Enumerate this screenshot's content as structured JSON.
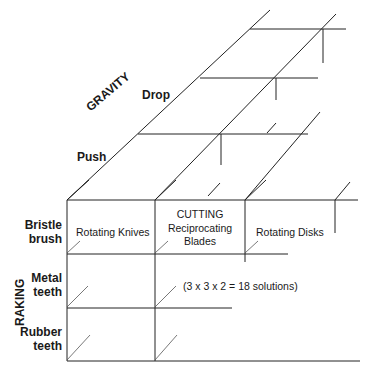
{
  "diagram": {
    "type": "morphological-box",
    "axes": {
      "gravity": {
        "label": "GRAVITY",
        "options": [
          "Push",
          "Drop"
        ]
      },
      "raking": {
        "label": "RAKING",
        "options": [
          "Bristle brush",
          "Metal teeth",
          "Rubber teeth"
        ]
      },
      "cutting": {
        "label": "CUTTING",
        "options": [
          "Rotating Knives",
          "Reciprocating Blades",
          "Rotating Disks"
        ]
      }
    },
    "labels": {
      "gravity": "GRAVITY",
      "drop": "Drop",
      "push": "Push",
      "raking": "RAKING",
      "bristle_1": "Bristle",
      "bristle_2": "brush",
      "metal_1": "Metal",
      "metal_2": "teeth",
      "rubber_1": "Rubber",
      "rubber_2": "teeth",
      "cutting": "CUTTING",
      "knives": "Rotating Knives",
      "recip_1": "Reciprocating",
      "recip_2": "Blades",
      "disks": "Rotating Disks",
      "solutions": "(3 x 3 x 2 = 18 solutions)"
    },
    "line_color": "#222222"
  }
}
